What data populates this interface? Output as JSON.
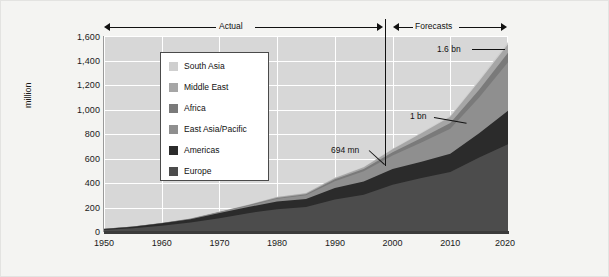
{
  "chart_data": {
    "type": "area",
    "stacked": true,
    "title": "",
    "xlabel": "",
    "ylabel": "million",
    "xlim": [
      1950,
      2020
    ],
    "ylim": [
      0,
      1600
    ],
    "grid": true,
    "legend_position": "inside-upper-left",
    "x": [
      1950,
      1955,
      1960,
      1965,
      1970,
      1975,
      1980,
      1985,
      1990,
      1995,
      2000,
      2005,
      2010,
      2015,
      2020
    ],
    "xticks": [
      "1950",
      "1960",
      "1970",
      "1980",
      "1990",
      "2000",
      "2010",
      "2020"
    ],
    "yticks": [
      "0",
      "200",
      "400",
      "600",
      "800",
      "1,000",
      "1,200",
      "1,400",
      "1,600"
    ],
    "series": [
      {
        "name": "Europe",
        "color": "#4c4c4c",
        "values": [
          17,
          30,
          51,
          77,
          113,
          154,
          186,
          204,
          266,
          304,
          386,
          441,
          489,
          608,
          717
        ]
      },
      {
        "name": "Americas",
        "color": "#2b2b2b",
        "values": [
          8,
          13,
          20,
          28,
          42,
          50,
          62,
          65,
          93,
          109,
          128,
          133,
          150,
          199,
          272
        ]
      },
      {
        "name": "East Asia/Pacific",
        "color": "#8f8f8f",
        "values": [
          0.2,
          1,
          1,
          2,
          6,
          10,
          23,
          31,
          56,
          82,
          110,
          156,
          204,
          290,
          397
        ]
      },
      {
        "name": "Africa",
        "color": "#7a7a7a",
        "values": [
          0.5,
          1,
          1,
          2,
          3,
          5,
          7,
          9,
          15,
          20,
          27,
          37,
          47,
          64,
          77
        ]
      },
      {
        "name": "Middle East",
        "color": "#a6a6a6",
        "values": [
          0.2,
          0.4,
          1,
          2,
          2,
          4,
          7,
          8,
          10,
          14,
          25,
          39,
          51,
          69,
          69
        ]
      },
      {
        "name": "South Asia",
        "color": "#cfcfcf",
        "values": [
          0.2,
          0.3,
          0.5,
          1,
          1,
          2,
          2,
          3,
          4,
          4,
          6,
          8,
          11,
          14,
          19
        ]
      }
    ],
    "annotations": [
      {
        "label": "694 mn",
        "x": 2005,
        "value": 694
      },
      {
        "label": "1 bn",
        "x": 2012,
        "value": 1000
      },
      {
        "label": "1.6 bn",
        "x": 2020,
        "value": 1600
      }
    ],
    "period_bands": [
      {
        "label": "Actual",
        "start": 1950,
        "end": 2005
      },
      {
        "label": "Forecasts",
        "start": 2005,
        "end": 2020
      }
    ]
  },
  "axes": {
    "y": {
      "label": "million",
      "ticks": [
        "1,600",
        "1,400",
        "1,200",
        "1,000",
        "800",
        "600",
        "400",
        "200",
        "0"
      ]
    },
    "x": {
      "ticks": [
        "1950",
        "1960",
        "1970",
        "1980",
        "1990",
        "2000",
        "2010",
        "2020"
      ]
    }
  },
  "bands": {
    "actual": "Actual",
    "forecasts": "Forecasts"
  },
  "callouts": {
    "peak": "1.6 bn",
    "billion": "1 bn",
    "actual_end": "694 mn"
  },
  "legend": {
    "items": [
      {
        "label": "South Asia",
        "color": "#cfcfcf"
      },
      {
        "label": "Middle East",
        "color": "#a6a6a6"
      },
      {
        "label": "Africa",
        "color": "#7a7a7a"
      },
      {
        "label": "East Asia/Pacific",
        "color": "#8f8f8f"
      },
      {
        "label": "Americas",
        "color": "#2b2b2b"
      },
      {
        "label": "Europe",
        "color": "#4c4c4c"
      }
    ]
  },
  "colors": {
    "figure_background": "#f4f4f2",
    "plot_background": "#d7d7d7",
    "gridline": "#ffffff",
    "axis": "#3b3b3b",
    "text": "#1a1a1a"
  }
}
